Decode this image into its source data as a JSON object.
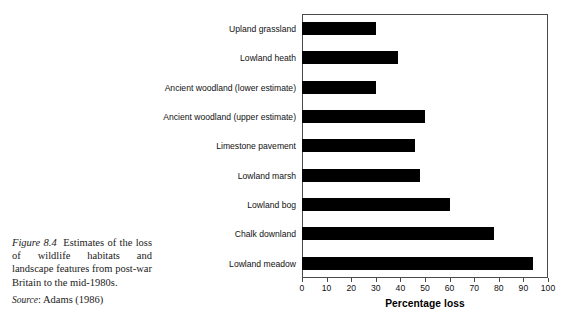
{
  "chart_data": {
    "type": "bar",
    "orientation": "horizontal",
    "title": "",
    "xlabel": "Percentage loss",
    "ylabel": "",
    "xlim": [
      0,
      100
    ],
    "xticks": [
      0,
      10,
      20,
      30,
      40,
      50,
      60,
      70,
      80,
      90,
      100
    ],
    "grid": false,
    "legend": false,
    "bar_color": "#000000",
    "categories": [
      "Upland grassland",
      "Lowland heath",
      "Ancient woodland (lower estimate)",
      "Ancient woodland (upper estimate)",
      "Limestone pavement",
      "Lowland marsh",
      "Lowland bog",
      "Chalk downland",
      "Lowland meadow"
    ],
    "values": [
      30,
      39,
      30,
      50,
      46,
      48,
      60,
      78,
      94
    ]
  },
  "caption": {
    "figure_label": "Figure 8.4",
    "text": "Estimates of the loss of wildlife habitats and landscape features from post-war Britain to the mid-1980s.",
    "source_label": "Source",
    "source_text": ": Adams (1986)"
  }
}
